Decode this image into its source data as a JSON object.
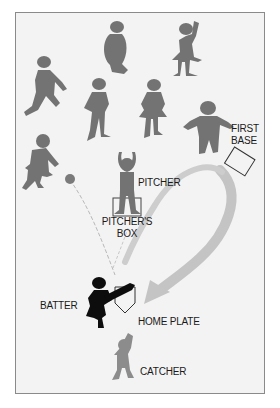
{
  "diagram": {
    "title": "",
    "colors": {
      "background": "#f3f3f3",
      "frame_border": "#8a8a8a",
      "fielder": "#737373",
      "batter": "#0d0d0d",
      "catcher": "#8c8c8c",
      "arrow": "#c4c4c4",
      "text": "#1a1a1a"
    },
    "labels": {
      "first_base": [
        "FIRST",
        "BASE"
      ],
      "pitcher": "PITCHER",
      "pitchers_box": [
        "PITCHER'S",
        "BOX"
      ],
      "batter": "BATTER",
      "home_plate": "HOME PLATE",
      "catcher": "CATCHER"
    },
    "figures": [
      {
        "role": "fielder",
        "pose": "standing-side"
      },
      {
        "role": "fielder",
        "pose": "arm-raised"
      },
      {
        "role": "fielder",
        "pose": "running"
      },
      {
        "role": "fielder",
        "pose": "hands-on-hips"
      },
      {
        "role": "fielder",
        "pose": "standing-skirt"
      },
      {
        "role": "first-baseman",
        "pose": "arms-out"
      },
      {
        "role": "fielder",
        "pose": "running-skirt"
      },
      {
        "role": "pitcher",
        "pose": "arms-overhead"
      },
      {
        "role": "batter",
        "pose": "swinging"
      },
      {
        "role": "catcher",
        "pose": "arm-raised"
      }
    ],
    "elements": [
      "ball",
      "ball-trajectory",
      "first-base",
      "pitchers-box",
      "home-plate",
      "return-arrow"
    ]
  }
}
